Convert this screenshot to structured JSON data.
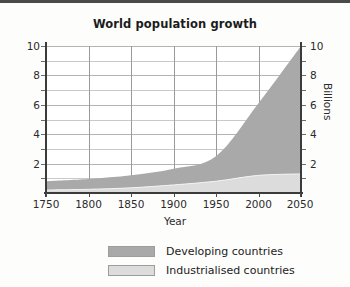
{
  "chart_data": {
    "type": "area",
    "title": "World population growth",
    "xlabel": "Year",
    "ylabel": "Billions",
    "ylabel_right": "Billions",
    "xlim": [
      1750,
      2050
    ],
    "ylim": [
      0,
      10
    ],
    "grid": true,
    "stacked": true,
    "legend_position": "bottom",
    "x_ticks": [
      1750,
      1800,
      1850,
      1900,
      1950,
      2000,
      2050
    ],
    "y_ticks": [
      0,
      2,
      4,
      6,
      8,
      10
    ],
    "y_ticks_labeled": [
      2,
      4,
      6,
      8,
      10
    ],
    "y_minor_ticks": [
      1,
      3,
      5,
      7,
      9
    ],
    "x": [
      1750,
      1800,
      1850,
      1900,
      1950,
      2000,
      2050
    ],
    "series": [
      {
        "name": "Industrialised countries",
        "color": "#dcdcdc",
        "values": [
          0.2,
          0.25,
          0.35,
          0.55,
          0.8,
          1.2,
          1.3
        ]
      },
      {
        "name": "Developing countries",
        "color": "#a9a9a9",
        "values": [
          0.6,
          0.7,
          0.85,
          1.1,
          1.7,
          4.9,
          8.7
        ]
      }
    ],
    "totals": [
      0.8,
      0.95,
      1.2,
      1.65,
      2.5,
      6.1,
      10.0
    ]
  },
  "legend": {
    "items": [
      {
        "label": "Developing countries",
        "color": "#a9a9a9"
      },
      {
        "label": "Industrialised countries",
        "color": "#dcdcdc"
      }
    ]
  },
  "axis_labels": {
    "y_left": [
      "10",
      "8",
      "6",
      "4",
      "2"
    ],
    "y_right": [
      "10",
      "8",
      "6",
      "4",
      "2"
    ],
    "x": [
      "1750",
      "1800",
      "1850",
      "1900",
      "1950",
      "2000",
      "2050"
    ]
  }
}
